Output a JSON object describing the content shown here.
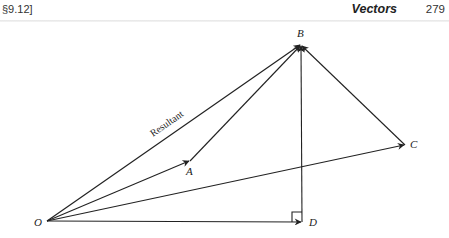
{
  "header": {
    "section": "§9.12]",
    "title": "Vectors",
    "page_number": "279"
  },
  "diagram": {
    "points": {
      "O": {
        "label": "O",
        "x": 47,
        "y": 221
      },
      "A": {
        "label": "A",
        "x": 190,
        "y": 161
      },
      "B": {
        "label": "B",
        "x": 301,
        "y": 44
      },
      "C": {
        "label": "C",
        "x": 405,
        "y": 145
      },
      "D": {
        "label": "D",
        "x": 302,
        "y": 222
      }
    },
    "vectors": [
      {
        "from": "O",
        "to": "B",
        "label": "Resultant"
      },
      {
        "from": "O",
        "to": "A"
      },
      {
        "from": "A",
        "to": "B"
      },
      {
        "from": "O",
        "to": "C"
      },
      {
        "from": "C",
        "to": "B"
      },
      {
        "from": "O",
        "to": "D"
      },
      {
        "from": "D",
        "to": "B"
      }
    ],
    "right_angle_at": "D",
    "resultant_label": "Resultant",
    "line_color": "#222222"
  }
}
